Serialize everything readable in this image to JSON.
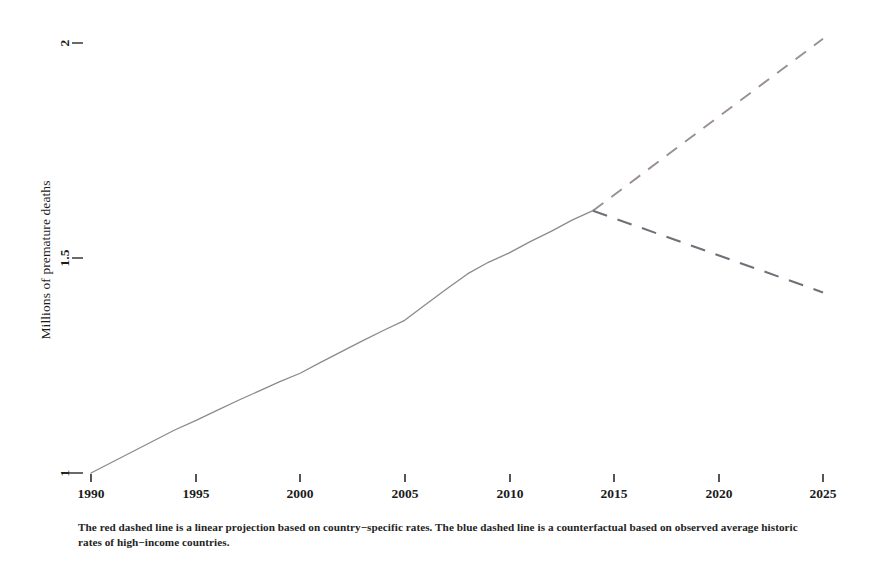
{
  "chart_data": {
    "type": "line",
    "title": "",
    "xlabel": "",
    "ylabel": "Millions of premature deaths",
    "xlim": [
      1989,
      2026
    ],
    "ylim": [
      0.98,
      2.04
    ],
    "xticks": [
      1990,
      1995,
      2000,
      2005,
      2010,
      2015,
      2020,
      2025
    ],
    "xtick_labels": [
      "1990",
      "1995",
      "2000",
      "2005",
      "2010",
      "2015",
      "2020",
      "2025"
    ],
    "yticks": [
      1,
      1.5,
      2
    ],
    "ytick_labels": [
      "1",
      "1.5",
      "2"
    ],
    "grid": false,
    "legend": "none",
    "series": [
      {
        "name": "observed",
        "style": "solid",
        "color": "#8a8a92",
        "x": [
          1990,
          1991,
          1992,
          1993,
          1994,
          1995,
          1996,
          1997,
          1998,
          1999,
          2000,
          2001,
          2002,
          2003,
          2004,
          2005,
          2006,
          2007,
          2008,
          2009,
          2010,
          2011,
          2012,
          2013,
          2014
        ],
        "y": [
          1.0,
          1.025,
          1.05,
          1.075,
          1.1,
          1.122,
          1.145,
          1.168,
          1.19,
          1.212,
          1.232,
          1.258,
          1.283,
          1.308,
          1.332,
          1.355,
          1.392,
          1.428,
          1.463,
          1.49,
          1.512,
          1.538,
          1.562,
          1.588,
          1.61
        ]
      },
      {
        "name": "red dashed linear projection",
        "style": "dashed",
        "color": "#9a8f92",
        "x": [
          2014,
          2025
        ],
        "y": [
          1.61,
          2.01
        ]
      },
      {
        "name": "blue dashed counterfactual",
        "style": "dashed",
        "color": "#6f7178",
        "x": [
          2014,
          2025
        ],
        "y": [
          1.61,
          1.42
        ]
      }
    ],
    "annotations": {
      "caption": "The red dashed line is a linear projection based on country−specific rates. The blue dashed line is a counterfactual based on observed average historic rates of high−income countries."
    }
  },
  "axis": {
    "y_title": "Millions of premature deaths",
    "y_ticks": [
      {
        "label": "1",
        "value": 1
      },
      {
        "label": "1.5",
        "value": 1.5
      },
      {
        "label": "2",
        "value": 2
      }
    ],
    "x_ticks": [
      {
        "label": "1990",
        "value": 1990
      },
      {
        "label": "1995",
        "value": 1995
      },
      {
        "label": "2000",
        "value": 2000
      },
      {
        "label": "2005",
        "value": 2005
      },
      {
        "label": "2010",
        "value": 2010
      },
      {
        "label": "2015",
        "value": 2015
      },
      {
        "label": "2020",
        "value": 2020
      },
      {
        "label": "2025",
        "value": 2025
      }
    ]
  },
  "caption": {
    "text": "The red dashed line is a linear projection based on country−specific rates. The blue dashed line is a counterfactual based on observed average historic rates of high−income countries."
  },
  "colors": {
    "background": "#ffffff",
    "text": "#1b1b1b",
    "solid_line": "#8a8a92",
    "projection_line": "#9a8f92",
    "counterfactual_line": "#6f7178"
  }
}
